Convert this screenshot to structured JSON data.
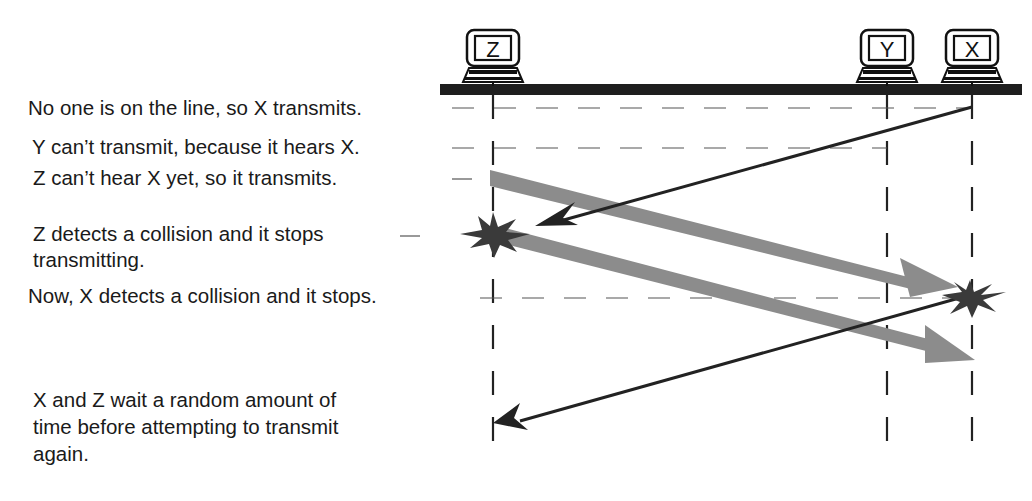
{
  "nodes": [
    {
      "id": "Z",
      "label": "Z",
      "x": 493
    },
    {
      "id": "Y",
      "label": "Y",
      "x": 887
    },
    {
      "id": "X",
      "label": "X",
      "x": 972
    }
  ],
  "events": [
    {
      "id": "x-transmits",
      "text": "No one is on the line, so X transmits."
    },
    {
      "id": "y-waits",
      "text": "Y can’t transmit, because it hears X."
    },
    {
      "id": "z-transmits",
      "text": "Z can’t hear X yet, so it transmits."
    },
    {
      "id": "z-detects-line1",
      "text": "Z detects a collision and it stops"
    },
    {
      "id": "z-detects-line2",
      "text": "transmitting."
    },
    {
      "id": "x-detects",
      "text": "Now, X detects a collision and it stops."
    },
    {
      "id": "backoff-line1",
      "text": "X and Z wait a random amount of"
    },
    {
      "id": "backoff-line2",
      "text": "time before attempting to transmit"
    },
    {
      "id": "backoff-line3",
      "text": "again."
    }
  ],
  "colors": {
    "bus": "#1e1e1e",
    "signal_x": "#222222",
    "signal_z": "#8c8c8c",
    "collision": "#3a3a3a",
    "guide": "#555555"
  }
}
